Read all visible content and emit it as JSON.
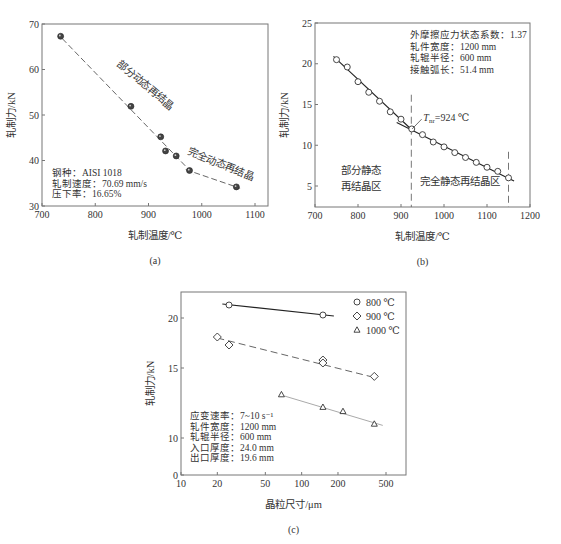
{
  "chart_data": [
    {
      "id": "a",
      "type": "scatter",
      "caption": "(a)",
      "xlabel": "轧制温度/℃",
      "ylabel": "轧制力/kN",
      "xlim": [
        700,
        1125
      ],
      "ylim": [
        30,
        70
      ],
      "xticks": [
        700,
        800,
        900,
        1000,
        1100
      ],
      "yticks": [
        30,
        40,
        50,
        60,
        70
      ],
      "series": [
        {
          "name": "measured",
          "marker": "filled-circle",
          "x": [
            735,
            867,
            923,
            932,
            952,
            977,
            1065
          ],
          "y": [
            67.3,
            51.9,
            45.2,
            42.1,
            41.0,
            37.8,
            34.2
          ]
        }
      ],
      "fit_lines": [
        {
          "style": "dashed",
          "x": [
            738,
            985
          ],
          "y": [
            66.8,
            36.9
          ]
        },
        {
          "style": "dashed",
          "x": [
            970,
            1072
          ],
          "y": [
            38.0,
            33.9
          ]
        }
      ],
      "annotations": [
        {
          "text": "部分动态再结晶",
          "x": 890,
          "y": 56,
          "rotate": 40
        },
        {
          "text": "完全动态再结晶",
          "x": 1033,
          "y": 38.5,
          "rotate": 22
        }
      ],
      "info": [
        "钢种：AISI 1018",
        "轧制速度：70.69 mm/s",
        "压下率：16.65%"
      ]
    },
    {
      "id": "b",
      "type": "scatter",
      "caption": "(b)",
      "xlabel": "轧制温度/℃",
      "ylabel": "轧制力/kN",
      "xlim": [
        700,
        1200
      ],
      "ylim": [
        2.5,
        25
      ],
      "xticks": [
        700,
        800,
        900,
        1000,
        1100,
        1200
      ],
      "yticks": [
        5,
        10,
        15,
        20,
        25
      ],
      "series": [
        {
          "name": "measured",
          "marker": "open-circle",
          "x": [
            750,
            775,
            800,
            825,
            850,
            875,
            900,
            925,
            950,
            975,
            1000,
            1025,
            1050,
            1075,
            1100,
            1125,
            1150
          ],
          "y": [
            20.5,
            19.6,
            17.8,
            16.5,
            15.4,
            14.1,
            13.2,
            12.0,
            11.3,
            10.4,
            9.8,
            9.1,
            8.5,
            7.9,
            7.3,
            6.8,
            6.0
          ]
        }
      ],
      "fit_lines": [
        {
          "style": "solid",
          "x": [
            743,
            925
          ],
          "y": [
            20.9,
            11.9
          ]
        },
        {
          "style": "solid",
          "x": [
            890,
            1163
          ],
          "y": [
            12.8,
            5.6
          ]
        }
      ],
      "vlines": [
        924,
        1150
      ],
      "annotations": [
        {
          "text": "T",
          "sub": "nr",
          "suffix": "=924 ℃",
          "x": 952,
          "y": 13.3
        },
        {
          "text": "部分静态",
          "x": 760,
          "y": 6.5
        },
        {
          "text": "再结晶区",
          "x": 760,
          "y": 4.5
        },
        {
          "text": "完全静态再结晶区",
          "x": 945,
          "y": 5.1
        }
      ],
      "info": [
        "外摩擦应力状态系数：1.37",
        "轧件宽度：1200 mm",
        "轧辊半径：600 mm",
        "接触弧长：51.4 mm"
      ]
    },
    {
      "id": "c",
      "type": "scatter",
      "caption": "(c)",
      "xlabel": "晶粒尺寸/μm",
      "ylabel": "轧制力/kN",
      "xscale": "log",
      "xlim": [
        10,
        700
      ],
      "ylim": [
        0,
        22
      ],
      "xticks": [
        10,
        20,
        50,
        100,
        200,
        500
      ],
      "yticks": [
        0,
        10,
        15,
        20
      ],
      "legend": {
        "position": "upper right",
        "entries": [
          "800 ℃",
          "900 ℃",
          "1000 ℃"
        ]
      },
      "series": [
        {
          "name": "800 ℃",
          "marker": "open-circle",
          "line": "solid",
          "x": [
            25,
            150
          ],
          "y": [
            21.3,
            20.3
          ],
          "fit": {
            "x": [
              22,
              185
            ],
            "y": [
              21.4,
              20.2
            ]
          }
        },
        {
          "name": "900 ℃",
          "marker": "open-diamond",
          "line": "dashed",
          "x": [
            20,
            25,
            150,
            150,
            400
          ],
          "y": [
            18.1,
            17.3,
            15.8,
            15.5,
            14.4
          ],
          "fit": {
            "x": [
              20,
              410
            ],
            "y": [
              18.0,
              14.3
            ]
          }
        },
        {
          "name": "1000 ℃",
          "marker": "open-triangle",
          "line": "dotted-light",
          "x": [
            68,
            150,
            220,
            400
          ],
          "y": [
            13.1,
            12.2,
            11.9,
            11.0
          ],
          "fit": {
            "x": [
              72,
              470
            ],
            "y": [
              13.0,
              10.9
            ]
          }
        }
      ],
      "info": [
        "应变速率：7~10 s⁻¹",
        "轧件宽度：1200 mm",
        "轧辊半径：600 mm",
        "入口厚度：24.0 mm",
        "出口厚度：19.6 mm"
      ]
    }
  ],
  "colors": {
    "axis": "#777777",
    "data": "#333333",
    "text": "#333333",
    "light_line": "#aaaaaa"
  }
}
